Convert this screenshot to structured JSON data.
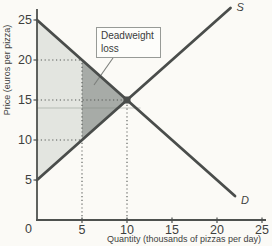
{
  "chart_data": {
    "type": "line",
    "title": "",
    "xlabel": "Quantity (thousands of pizzas per day)",
    "ylabel": "Price (euros per pizza)",
    "xlim": [
      0,
      25.5
    ],
    "ylim": [
      0,
      27.5
    ],
    "x_ticks": [
      5,
      10,
      15,
      20,
      25
    ],
    "y_ticks": [
      5,
      10,
      15,
      20,
      25
    ],
    "origin_label": "0",
    "grid": "off",
    "legend": "none (curves labeled inline)",
    "series": [
      {
        "name": "supply",
        "label": "S",
        "points": [
          [
            0,
            5
          ],
          [
            21.5,
            26.5
          ]
        ]
      },
      {
        "name": "demand",
        "label": "D",
        "points": [
          [
            0,
            25
          ],
          [
            22,
            3
          ]
        ]
      }
    ],
    "equilibrium": {
      "quantity": 10,
      "price": 15
    },
    "regions": [
      {
        "name": "shaded-surplus-region",
        "points": [
          [
            0,
            25
          ],
          [
            5,
            20
          ],
          [
            5,
            10
          ],
          [
            0,
            5
          ]
        ],
        "fill": "#e3e5e0"
      },
      {
        "name": "deadweight-loss-region",
        "points": [
          [
            5,
            20
          ],
          [
            10,
            15
          ],
          [
            5,
            10
          ]
        ],
        "fill": "#a7aba7"
      }
    ],
    "guide_lines": [
      {
        "name": "price-20-dotted",
        "from": [
          0,
          20
        ],
        "to": [
          5,
          20
        ]
      },
      {
        "name": "price-15-dotted",
        "from": [
          0,
          15
        ],
        "to": [
          10,
          15
        ]
      },
      {
        "name": "price-10-dotted",
        "from": [
          0,
          10
        ],
        "to": [
          5,
          10
        ]
      },
      {
        "name": "quantity-5-dotted",
        "from": [
          5,
          0
        ],
        "to": [
          5,
          20
        ]
      },
      {
        "name": "quantity-10-dotted",
        "from": [
          10,
          0
        ],
        "to": [
          10,
          15
        ]
      }
    ],
    "artifact_line": {
      "price": 14,
      "q_from": 0,
      "q_to": 11.5
    },
    "annotation": {
      "line1": "Deadweight",
      "line2": "loss"
    },
    "colors": {
      "background": "#fbfaf6",
      "curve": "#4a4d4b",
      "axis": "#4e514f",
      "dotted": "#555855",
      "text": "#3e3f3e",
      "light_region": "#e3e5e0",
      "dark_region": "#a7aba7",
      "box_border": "#979a96",
      "box_fill": "#fdfdfa",
      "leader": "#7c7f7b"
    }
  }
}
